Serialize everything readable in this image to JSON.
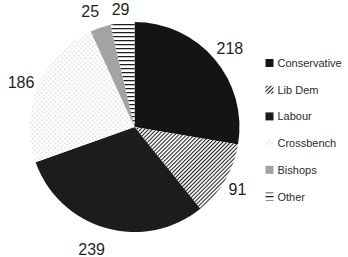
{
  "chart_data": {
    "type": "pie",
    "title": "",
    "legend_position": "right",
    "data_labels": "outside-values",
    "start_angle_deg": 0,
    "direction": "clockwise",
    "total": 788,
    "categories": [
      "Conservative",
      "Lib Dem",
      "Labour",
      "Crossbench",
      "Bishops",
      "Other"
    ],
    "values": [
      218,
      91,
      239,
      186,
      25,
      29
    ],
    "slices": [
      {
        "label": "Conservative",
        "value": 218,
        "fill_type": "solid",
        "fill": "#141414"
      },
      {
        "label": "Lib Dem",
        "value": 91,
        "fill_type": "pattern",
        "fill": "diagonal-stripes"
      },
      {
        "label": "Labour",
        "value": 239,
        "fill_type": "solid",
        "fill": "#1c1c1c"
      },
      {
        "label": "Crossbench",
        "value": 186,
        "fill_type": "pattern",
        "fill": "light-dots"
      },
      {
        "label": "Bishops",
        "value": 25,
        "fill_type": "solid",
        "fill": "#a3a3a3"
      },
      {
        "label": "Other",
        "value": 29,
        "fill_type": "pattern",
        "fill": "horizontal-stripes"
      }
    ],
    "style": {
      "background": "#ffffff",
      "pattern_ink": "#1d1d1d",
      "pattern_background": "#ffffff",
      "dot_ink": "#c4c4c4",
      "value_label_color": "#1f1f1f",
      "legend_text_color": "#2b2b2b"
    }
  }
}
